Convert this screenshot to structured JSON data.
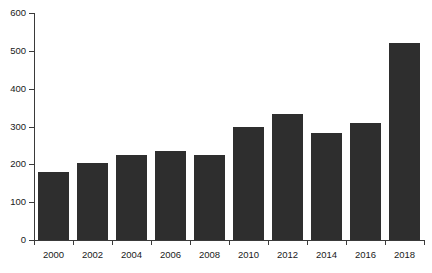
{
  "chart_data": {
    "type": "bar",
    "title": "",
    "subtitle": "",
    "xlabel": "",
    "ylabel": "",
    "categories": [
      "2000",
      "2002",
      "2004",
      "2006",
      "2008",
      "2010",
      "2012",
      "2014",
      "2016",
      "2018"
    ],
    "values": [
      180,
      203,
      225,
      236,
      225,
      300,
      334,
      283,
      310,
      522
    ],
    "series": [
      {
        "name": "value",
        "values": [
          180,
          203,
          225,
          236,
          225,
          300,
          334,
          283,
          310,
          522
        ]
      }
    ],
    "ylim": [
      0,
      600
    ],
    "y_ticks": [
      0,
      100,
      200,
      300,
      400,
      500,
      600
    ],
    "y_tick_labels": [
      "0",
      "100",
      "200",
      "300",
      "400",
      "500",
      "600"
    ],
    "x_tick_labels": [
      "2000",
      "2002",
      "2004",
      "2006",
      "2008",
      "2010",
      "2012",
      "2014",
      "2016",
      "2018"
    ],
    "grid": false,
    "legend": false,
    "legend_position": "none",
    "annotations": [],
    "colors": {
      "bar_fill": "#2e2e2e",
      "axis": "#3a3a3a",
      "text": "#1a1a1a",
      "background": "#ffffff"
    }
  }
}
